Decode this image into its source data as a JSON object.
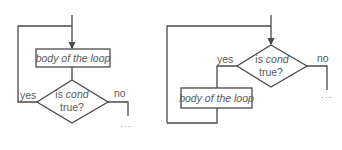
{
  "diagrams": [
    {
      "name": "do-while-loop",
      "body_label": "body of the loop",
      "cond_prefix": "is ",
      "cond_var": "cond",
      "cond_suffix": "true?",
      "yes_label": "yes",
      "no_label": "no",
      "continuation": "..."
    },
    {
      "name": "while-loop",
      "body_label": "body of the loop",
      "cond_prefix": "is ",
      "cond_var": "cond",
      "cond_suffix": "true?",
      "yes_label": "yes",
      "no_label": "no",
      "continuation": "..."
    }
  ]
}
